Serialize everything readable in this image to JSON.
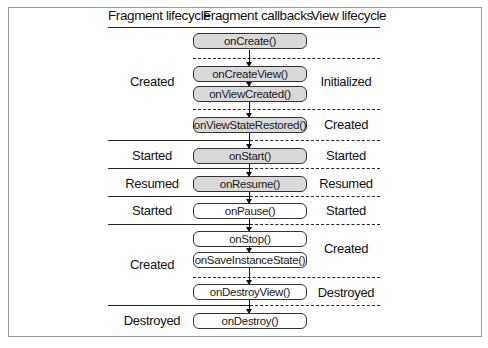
{
  "headers": {
    "fragment_lifecycle": "Fragment lifecycle",
    "fragment_callbacks": "Fragment callbacks",
    "view_lifecycle": "View lifecycle"
  },
  "callbacks": [
    {
      "label": "onCreate()",
      "fill": "gray"
    },
    {
      "label": "onCreateView()",
      "fill": "gray"
    },
    {
      "label": "onViewCreated()",
      "fill": "gray"
    },
    {
      "label": "onViewStateRestored()",
      "fill": "gray"
    },
    {
      "label": "onStart()",
      "fill": "gray"
    },
    {
      "label": "onResume()",
      "fill": "gray"
    },
    {
      "label": "onPause()",
      "fill": "white"
    },
    {
      "label": "onStop()",
      "fill": "white"
    },
    {
      "label": "onSaveInstanceState()",
      "fill": "white"
    },
    {
      "label": "onDestroyView()",
      "fill": "white"
    },
    {
      "label": "onDestroy()",
      "fill": "white"
    }
  ],
  "fragment_states": [
    {
      "label": "Created"
    },
    {
      "label": "Started"
    },
    {
      "label": "Resumed"
    },
    {
      "label": "Started"
    },
    {
      "label": "Created"
    },
    {
      "label": "Destroyed"
    }
  ],
  "view_states": [
    {
      "label": "Initialized"
    },
    {
      "label": "Created"
    },
    {
      "label": "Started"
    },
    {
      "label": "Resumed"
    },
    {
      "label": "Started"
    },
    {
      "label": "Created"
    },
    {
      "label": "Destroyed"
    }
  ],
  "colors": {
    "box_gray": "#d9d9d9",
    "box_white": "#ffffff",
    "line": "#222222",
    "frame": "#9a9a9a"
  }
}
